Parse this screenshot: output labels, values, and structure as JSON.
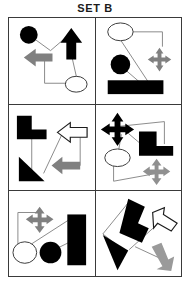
{
  "title": "SET B",
  "colors": {
    "black": "#000000",
    "gray": "#808080",
    "white": "#ffffff",
    "stroke": "#7a7a7a",
    "border": "#3a3a3a",
    "background": "#ffffff"
  },
  "grid": {
    "rows": 3,
    "columns": 2,
    "cell_count": 6
  },
  "cells": [
    {
      "id": "cell-1",
      "position": "row1-col1",
      "shapes": [
        {
          "name": "black-circle",
          "fill": "black",
          "shape": "circle"
        },
        {
          "name": "black-up-arrow",
          "fill": "black",
          "shape": "arrow-up"
        },
        {
          "name": "gray-left-arrow",
          "fill": "gray",
          "shape": "arrow-left"
        },
        {
          "name": "white-ellipse",
          "fill": "white",
          "shape": "ellipse"
        }
      ],
      "connector_count": 3
    },
    {
      "id": "cell-2",
      "position": "row1-col2",
      "shapes": [
        {
          "name": "white-ellipse",
          "fill": "white",
          "shape": "ellipse"
        },
        {
          "name": "gray-four-way-arrow",
          "fill": "gray",
          "shape": "arrow-four-way"
        },
        {
          "name": "black-circle",
          "fill": "black",
          "shape": "circle"
        },
        {
          "name": "black-rectangle",
          "fill": "black",
          "shape": "rectangle"
        }
      ],
      "connector_count": 3
    },
    {
      "id": "cell-3",
      "position": "row2-col1",
      "shapes": [
        {
          "name": "black-l-shape",
          "fill": "black",
          "shape": "l-shape"
        },
        {
          "name": "white-left-arrow",
          "fill": "white",
          "shape": "arrow-left"
        },
        {
          "name": "black-triangle",
          "fill": "black",
          "shape": "triangle"
        },
        {
          "name": "gray-left-arrow",
          "fill": "gray",
          "shape": "arrow-left"
        }
      ],
      "connector_count": 3
    },
    {
      "id": "cell-4",
      "position": "row2-col2",
      "shapes": [
        {
          "name": "black-four-way-arrow",
          "fill": "black",
          "shape": "arrow-four-way"
        },
        {
          "name": "black-l-shape",
          "fill": "black",
          "shape": "l-shape"
        },
        {
          "name": "white-ellipse",
          "fill": "white",
          "shape": "ellipse"
        },
        {
          "name": "gray-four-way-arrow",
          "fill": "gray",
          "shape": "arrow-four-way"
        }
      ],
      "connector_count": 3
    },
    {
      "id": "cell-5",
      "position": "row3-col1",
      "shapes": [
        {
          "name": "gray-four-way-arrow",
          "fill": "gray",
          "shape": "arrow-four-way"
        },
        {
          "name": "black-rectangle",
          "fill": "black",
          "shape": "rectangle"
        },
        {
          "name": "white-ellipse",
          "fill": "white",
          "shape": "ellipse"
        },
        {
          "name": "black-circle",
          "fill": "black",
          "shape": "circle"
        }
      ],
      "connector_count": 3
    },
    {
      "id": "cell-6",
      "position": "row3-col2",
      "shapes": [
        {
          "name": "black-l-shape-rotated",
          "fill": "black",
          "shape": "l-shape"
        },
        {
          "name": "white-arrow-down-right",
          "fill": "white",
          "shape": "arrow"
        },
        {
          "name": "black-triangle",
          "fill": "black",
          "shape": "triangle"
        },
        {
          "name": "gray-arrow-down",
          "fill": "gray",
          "shape": "arrow"
        }
      ],
      "connector_count": 3
    }
  ]
}
